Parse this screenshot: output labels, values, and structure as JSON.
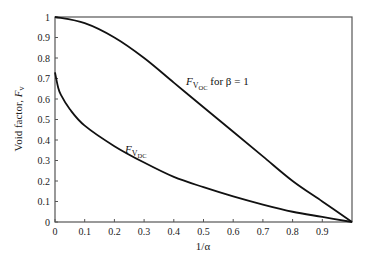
{
  "chart_data": {
    "type": "line",
    "title": "",
    "xlabel": "1/α",
    "ylabel": "Void factor, F_v",
    "xlim": [
      0,
      1
    ],
    "ylim": [
      0,
      1
    ],
    "grid": false,
    "legend": "none (inline annotations)",
    "x_ticks": [
      "0",
      "0.1",
      "0.2",
      "0.3",
      "0.4",
      "0.5",
      "0.6",
      "0.7",
      "0.8",
      "0.9"
    ],
    "y_ticks": [
      "0",
      "0.1",
      "0.2",
      "0.3",
      "0.4",
      "0.5",
      "0.6",
      "0.7",
      "0.8",
      "0.9",
      "1"
    ],
    "series": [
      {
        "name": "F_VOC for β = 1",
        "x": [
          0,
          0.1,
          0.2,
          0.3,
          0.4,
          0.5,
          0.6,
          0.7,
          0.8,
          0.9,
          1.0
        ],
        "values": [
          1.0,
          0.97,
          0.9,
          0.8,
          0.68,
          0.56,
          0.44,
          0.32,
          0.2,
          0.1,
          0.0
        ]
      },
      {
        "name": "F_VDC",
        "x": [
          0,
          0.01,
          0.02,
          0.05,
          0.1,
          0.2,
          0.3,
          0.4,
          0.5,
          0.6,
          0.7,
          0.8,
          0.9,
          1.0
        ],
        "values": [
          0.73,
          0.66,
          0.62,
          0.55,
          0.47,
          0.37,
          0.29,
          0.22,
          0.17,
          0.125,
          0.085,
          0.05,
          0.025,
          0.0
        ]
      }
    ],
    "annotations": [
      {
        "text": "F_VOC for β = 1",
        "at": [
          0.42,
          0.67
        ]
      },
      {
        "text": "F_VDC",
        "at": [
          0.18,
          0.34
        ]
      }
    ]
  },
  "labels": {
    "xlabel": "1/α",
    "ylabel_main": "Void factor, ",
    "ylabel_sym": "F",
    "ylabel_sub": "v",
    "annot_voc_F": "F",
    "annot_voc_V": "V",
    "annot_voc_sub": "OC",
    "annot_voc_rest": " for β = 1",
    "annot_vdc_F": "F",
    "annot_vdc_V": "V",
    "annot_vdc_sub": "DC"
  }
}
